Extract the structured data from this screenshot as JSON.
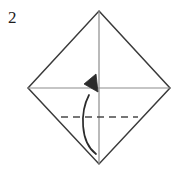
{
  "figure": {
    "kind": "origami-fold-diagram",
    "step_number": "2",
    "background_color": "#ffffff",
    "width": 188,
    "height": 175
  },
  "colors": {
    "paper_outline": "#3a3a3a",
    "crease_line": "#8c8c8c",
    "fold_line_dashed": "#4a4a4a",
    "arrow": "#2b2b2b",
    "label_text": "#1c1c1c"
  },
  "shapes": {
    "paper": {
      "name": "square-diamond",
      "points": "99,11 170,88 99,164 28,88",
      "stroke_width": 1.5
    },
    "vertical_crease": {
      "x1": 99,
      "y1": 11,
      "x2": 99,
      "y2": 164,
      "stroke_width": 1.2
    },
    "horizontal_crease": {
      "x1": 28,
      "y1": 88,
      "x2": 170,
      "y2": 88,
      "stroke_width": 1.2
    },
    "dashed_fold_line": {
      "x1": 61,
      "y1": 117,
      "x2": 138,
      "y2": 117,
      "stroke_width": 1.6,
      "dash_pattern": "7,5"
    },
    "fold_arrow": {
      "path": "M 96,154 C 80,140 82,112 89,96",
      "stroke_width": 1.7,
      "head_points": "96,74 99,91 84,85",
      "direction": "bottom-corner-up-to-center"
    }
  },
  "labels": {
    "step": "2"
  }
}
